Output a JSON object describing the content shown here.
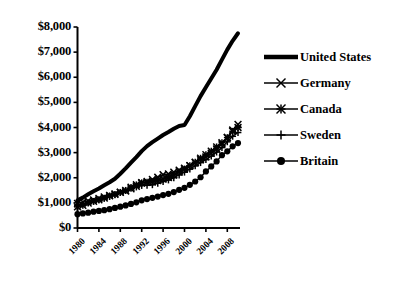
{
  "chart_data": {
    "type": "line",
    "title": "",
    "subtitle": "",
    "xlabel": "",
    "ylabel": "",
    "xlim": [
      1980,
      2010
    ],
    "ylim": [
      0,
      8000
    ],
    "grid": false,
    "legend_position": "right",
    "y_tick_labels": [
      "$8,000",
      "$7,000",
      "$6,000",
      "$5,000",
      "$4,000",
      "$3,000",
      "$2,000",
      "$1,000",
      "$0"
    ],
    "y_tick_values": [
      8000,
      7000,
      6000,
      5000,
      4000,
      3000,
      2000,
      1000,
      0
    ],
    "x_tick_labels": [
      "1980",
      "1984",
      "1988",
      "1992",
      "1996",
      "2000",
      "2004",
      "2008"
    ],
    "x_tick_values": [
      1980,
      1984,
      1988,
      1992,
      1996,
      2000,
      2004,
      2008
    ],
    "x": [
      1980,
      1981,
      1982,
      1983,
      1984,
      1985,
      1986,
      1987,
      1988,
      1989,
      1990,
      1991,
      1992,
      1993,
      1994,
      1995,
      1996,
      1997,
      1998,
      1999,
      2000,
      2001,
      2002,
      2003,
      2004,
      2005,
      2006,
      2007,
      2008,
      2009,
      2010
    ],
    "series": [
      {
        "name": "United States",
        "marker": "none",
        "line_width": 4,
        "color": "#000000",
        "values": [
          1100,
          1210,
          1340,
          1460,
          1570,
          1700,
          1820,
          1960,
          2160,
          2370,
          2600,
          2820,
          3060,
          3260,
          3420,
          3560,
          3700,
          3820,
          3950,
          4060,
          4100,
          4450,
          4850,
          5250,
          5600,
          5950,
          6300,
          6700,
          7100,
          7450,
          7750
        ]
      },
      {
        "name": "Germany",
        "marker": "x",
        "line_width": 1.4,
        "color": "#000000",
        "values": [
          980,
          1030,
          1080,
          1120,
          1180,
          1240,
          1300,
          1360,
          1430,
          1470,
          1560,
          1660,
          1800,
          1850,
          1930,
          2020,
          2120,
          2150,
          2220,
          2300,
          2380,
          2480,
          2600,
          2720,
          2830,
          2980,
          3150,
          3350,
          3600,
          3900,
          4120
        ]
      },
      {
        "name": "Canada",
        "marker": "asterisk",
        "line_width": 1.4,
        "color": "#000000",
        "values": [
          840,
          900,
          990,
          1060,
          1120,
          1190,
          1280,
          1340,
          1420,
          1500,
          1620,
          1720,
          1800,
          1820,
          1840,
          1890,
          1950,
          2010,
          2110,
          2230,
          2350,
          2480,
          2620,
          2780,
          2920,
          3060,
          3230,
          3400,
          3600,
          3850,
          4000
        ]
      },
      {
        "name": "Sweden",
        "marker": "plus",
        "line_width": 1.4,
        "color": "#000000",
        "values": [
          900,
          960,
          1010,
          1060,
          1120,
          1180,
          1250,
          1320,
          1410,
          1490,
          1580,
          1630,
          1690,
          1700,
          1720,
          1780,
          1850,
          1910,
          2000,
          2110,
          2220,
          2340,
          2470,
          2600,
          2720,
          2860,
          3020,
          3200,
          3430,
          3650,
          3800
        ]
      },
      {
        "name": "Britain",
        "marker": "circle",
        "line_width": 1.4,
        "color": "#000000",
        "values": [
          550,
          580,
          610,
          650,
          680,
          710,
          750,
          800,
          850,
          900,
          960,
          1020,
          1100,
          1150,
          1200,
          1250,
          1310,
          1360,
          1430,
          1520,
          1600,
          1720,
          1850,
          2020,
          2250,
          2450,
          2650,
          2900,
          3050,
          3250,
          3380
        ]
      }
    ]
  },
  "legend": {
    "items": [
      {
        "label": "United States",
        "marker": "none"
      },
      {
        "label": "Germany",
        "marker": "x"
      },
      {
        "label": "Canada",
        "marker": "asterisk"
      },
      {
        "label": "Sweden",
        "marker": "plus"
      },
      {
        "label": "Britain",
        "marker": "circle"
      }
    ]
  }
}
